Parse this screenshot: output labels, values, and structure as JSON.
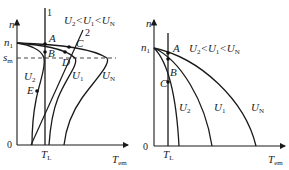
{
  "left": {
    "y_axis_label": "n",
    "x_axis_label_main": "T",
    "x_axis_label_sub": "em",
    "origin": "0",
    "n1_main": "n",
    "n1_sub": "1",
    "sm_main": "s",
    "sm_sub": "m",
    "tl_main": "T",
    "tl_sub": "L",
    "line1_label": "1",
    "line2_label": "2",
    "condition": "U2<U1<UN",
    "points": [
      "A",
      "B",
      "C",
      "D",
      "E"
    ],
    "curves": [
      {
        "main": "U",
        "sub": "2"
      },
      {
        "main": "U",
        "sub": "1"
      },
      {
        "main": "U",
        "sub": "N"
      }
    ]
  },
  "right": {
    "y_axis_label": "n",
    "x_axis_label_main": "T",
    "x_axis_label_sub": "em",
    "origin": "0",
    "n1_main": "n",
    "n1_sub": "1",
    "tl_main": "T",
    "tl_sub": "L",
    "condition": "U2<U1<UN",
    "points": [
      "A",
      "B",
      "C"
    ],
    "curves": [
      {
        "main": "U",
        "sub": "2"
      },
      {
        "main": "U",
        "sub": "1"
      },
      {
        "main": "U",
        "sub": "N"
      }
    ]
  }
}
